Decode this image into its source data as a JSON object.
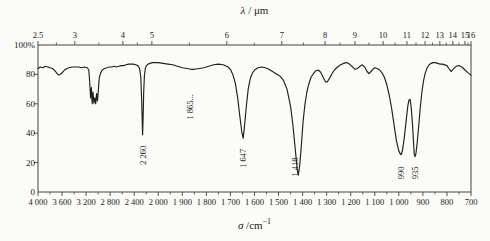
{
  "chart_data": {
    "type": "line",
    "colors": {
      "line": "#1f1f1f",
      "axis": "#444444",
      "text": "#1a1a1a",
      "background": "#fbfbf8"
    },
    "layout": {
      "plot": {
        "left": 38,
        "top": 45,
        "right": 471,
        "bottom": 192
      },
      "x_scale": "piecewise: 4000-2000 cm-1 at 400 per division, 2000-700 cm-1 at 100 per division, 18 equal divisions"
    },
    "top_axis": {
      "symbol": "λ",
      "title_rest": " / μm",
      "ticks": [
        {
          "label": "2.5",
          "pos": 0.0
        },
        {
          "label": "3",
          "pos": 0.085
        },
        {
          "label": "4",
          "pos": 0.196
        },
        {
          "label": "5",
          "pos": 0.263
        },
        {
          "label": "6",
          "pos": 0.436
        },
        {
          "label": "7",
          "pos": 0.563
        },
        {
          "label": "8",
          "pos": 0.663
        },
        {
          "label": "9",
          "pos": 0.732
        },
        {
          "label": "10",
          "pos": 0.797
        },
        {
          "label": "11",
          "pos": 0.852
        },
        {
          "label": "12",
          "pos": 0.894
        },
        {
          "label": "13",
          "pos": 0.928
        },
        {
          "label": "14",
          "pos": 0.958
        },
        {
          "label": "15",
          "pos": 0.986
        },
        {
          "label": "16",
          "pos": 1.0
        }
      ]
    },
    "bottom_axis": {
      "symbol": "σ",
      "title_rest": " /cm",
      "title_sup": "−1",
      "tick_labels": [
        "4 000",
        "3 600",
        "3 200",
        "2 800",
        "2 400",
        "2 000",
        "1 900",
        "1 800",
        "1 700",
        "1 600",
        "1 500",
        "1 400",
        "1 300",
        "1 200",
        "1 100",
        "1 000",
        "900",
        "800",
        "700"
      ],
      "tick_values": [
        4000,
        3600,
        3200,
        2800,
        2400,
        2000,
        1900,
        1800,
        1700,
        1600,
        1500,
        1400,
        1300,
        1200,
        1100,
        1000,
        900,
        800,
        700
      ]
    },
    "y_axis": {
      "tick_labels": [
        "100%",
        "80",
        "60",
        "40",
        "20",
        "0"
      ],
      "tick_values": [
        100,
        80,
        60,
        40,
        20,
        0
      ],
      "range": [
        0,
        100
      ]
    },
    "annotations": [
      {
        "label": "2 260",
        "sigma": 2260,
        "t": 25
      },
      {
        "label": "1 865...",
        "sigma": 1868,
        "t": 58
      },
      {
        "label": "1 647",
        "sigma": 1647,
        "t": 23
      },
      {
        "label": "1 418",
        "sigma": 1432,
        "t": 17
      },
      {
        "label": "990",
        "sigma": 992,
        "t": 13
      },
      {
        "label": "935",
        "sigma": 932,
        "t": 13
      }
    ],
    "curve": [
      [
        4000,
        84
      ],
      [
        3960,
        85
      ],
      [
        3920,
        84.5
      ],
      [
        3880,
        85.5
      ],
      [
        3840,
        85
      ],
      [
        3800,
        84.5
      ],
      [
        3760,
        84
      ],
      [
        3720,
        82.5
      ],
      [
        3680,
        80.5
      ],
      [
        3650,
        79.5
      ],
      [
        3620,
        80.5
      ],
      [
        3590,
        81.5
      ],
      [
        3560,
        83
      ],
      [
        3520,
        84
      ],
      [
        3480,
        84.5
      ],
      [
        3430,
        85
      ],
      [
        3380,
        85
      ],
      [
        3330,
        85
      ],
      [
        3280,
        84.5
      ],
      [
        3230,
        85
      ],
      [
        3180,
        84.5
      ],
      [
        3155,
        83
      ],
      [
        3140,
        75
      ],
      [
        3125,
        64
      ],
      [
        3112,
        71
      ],
      [
        3098,
        60
      ],
      [
        3085,
        68
      ],
      [
        3070,
        60.5
      ],
      [
        3055,
        64
      ],
      [
        3040,
        60
      ],
      [
        3025,
        67
      ],
      [
        3010,
        62
      ],
      [
        2995,
        70
      ],
      [
        2980,
        78
      ],
      [
        2958,
        81
      ],
      [
        2930,
        83
      ],
      [
        2895,
        84
      ],
      [
        2855,
        84.5
      ],
      [
        2815,
        85
      ],
      [
        2775,
        85
      ],
      [
        2735,
        85.5
      ],
      [
        2695,
        85
      ],
      [
        2655,
        85.5
      ],
      [
        2615,
        86
      ],
      [
        2575,
        86
      ],
      [
        2535,
        86.5
      ],
      [
        2495,
        87
      ],
      [
        2455,
        87
      ],
      [
        2415,
        87
      ],
      [
        2375,
        86.5
      ],
      [
        2340,
        86
      ],
      [
        2310,
        84
      ],
      [
        2290,
        78
      ],
      [
        2275,
        62
      ],
      [
        2265,
        46
      ],
      [
        2260,
        39
      ],
      [
        2252,
        50
      ],
      [
        2242,
        68
      ],
      [
        2230,
        79
      ],
      [
        2215,
        84
      ],
      [
        2200,
        86
      ],
      [
        2170,
        87
      ],
      [
        2140,
        87.5
      ],
      [
        2100,
        88
      ],
      [
        2060,
        88
      ],
      [
        2020,
        88
      ],
      [
        2000,
        88
      ],
      [
        1980,
        87.5
      ],
      [
        1960,
        87
      ],
      [
        1940,
        86.5
      ],
      [
        1920,
        85.5
      ],
      [
        1900,
        84.5
      ],
      [
        1880,
        84
      ],
      [
        1865,
        83.5
      ],
      [
        1850,
        83.5
      ],
      [
        1830,
        84
      ],
      [
        1810,
        84.5
      ],
      [
        1790,
        85.5
      ],
      [
        1770,
        86.5
      ],
      [
        1750,
        87
      ],
      [
        1730,
        86.5
      ],
      [
        1710,
        85
      ],
      [
        1700,
        83.5
      ],
      [
        1690,
        80
      ],
      [
        1680,
        74
      ],
      [
        1670,
        64
      ],
      [
        1660,
        50
      ],
      [
        1652,
        40
      ],
      [
        1647,
        36.5
      ],
      [
        1642,
        44
      ],
      [
        1634,
        58
      ],
      [
        1626,
        70
      ],
      [
        1618,
        77
      ],
      [
        1610,
        80.5
      ],
      [
        1600,
        83
      ],
      [
        1585,
        84.5
      ],
      [
        1570,
        85
      ],
      [
        1555,
        84.5
      ],
      [
        1540,
        83.5
      ],
      [
        1525,
        82
      ],
      [
        1510,
        80.5
      ],
      [
        1495,
        79
      ],
      [
        1480,
        76
      ],
      [
        1465,
        70
      ],
      [
        1450,
        58
      ],
      [
        1440,
        45
      ],
      [
        1430,
        28
      ],
      [
        1422,
        15
      ],
      [
        1418,
        11.5
      ],
      [
        1412,
        18
      ],
      [
        1405,
        32
      ],
      [
        1398,
        48
      ],
      [
        1390,
        60
      ],
      [
        1382,
        68
      ],
      [
        1375,
        73
      ],
      [
        1365,
        78
      ],
      [
        1355,
        80.5
      ],
      [
        1345,
        82.5
      ],
      [
        1335,
        83
      ],
      [
        1325,
        81.5
      ],
      [
        1315,
        78
      ],
      [
        1305,
        75
      ],
      [
        1297,
        75
      ],
      [
        1288,
        77.5
      ],
      [
        1278,
        80.5
      ],
      [
        1268,
        83
      ],
      [
        1255,
        85
      ],
      [
        1242,
        86.5
      ],
      [
        1230,
        87.5
      ],
      [
        1218,
        88
      ],
      [
        1205,
        87
      ],
      [
        1192,
        85
      ],
      [
        1182,
        83.5
      ],
      [
        1172,
        84
      ],
      [
        1162,
        85.5
      ],
      [
        1152,
        86.5
      ],
      [
        1142,
        85
      ],
      [
        1132,
        82
      ],
      [
        1124,
        80.5
      ],
      [
        1116,
        82
      ],
      [
        1108,
        83.5
      ],
      [
        1100,
        84.5
      ],
      [
        1090,
        84
      ],
      [
        1080,
        83
      ],
      [
        1070,
        81
      ],
      [
        1060,
        78
      ],
      [
        1050,
        73
      ],
      [
        1040,
        66
      ],
      [
        1030,
        57
      ],
      [
        1020,
        46
      ],
      [
        1010,
        35
      ],
      [
        1000,
        28
      ],
      [
        993,
        25.5
      ],
      [
        990,
        25.5
      ],
      [
        985,
        28
      ],
      [
        978,
        36
      ],
      [
        970,
        48
      ],
      [
        963,
        58
      ],
      [
        958,
        62.5
      ],
      [
        953,
        63
      ],
      [
        948,
        57
      ],
      [
        943,
        46
      ],
      [
        939,
        34
      ],
      [
        936,
        26
      ],
      [
        933,
        24
      ],
      [
        929,
        26
      ],
      [
        924,
        33
      ],
      [
        918,
        44
      ],
      [
        911,
        57
      ],
      [
        904,
        68
      ],
      [
        897,
        76
      ],
      [
        890,
        81
      ],
      [
        882,
        84.5
      ],
      [
        874,
        86.5
      ],
      [
        866,
        87.5
      ],
      [
        858,
        88
      ],
      [
        848,
        88
      ],
      [
        838,
        87.5
      ],
      [
        828,
        87
      ],
      [
        818,
        87
      ],
      [
        800,
        86
      ],
      [
        790,
        83.5
      ],
      [
        782,
        82
      ],
      [
        775,
        83.5
      ],
      [
        762,
        85.5
      ],
      [
        750,
        86
      ],
      [
        738,
        85
      ],
      [
        725,
        83
      ],
      [
        712,
        81
      ],
      [
        700,
        79.5
      ]
    ]
  }
}
